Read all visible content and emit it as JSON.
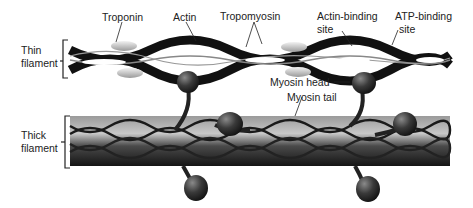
{
  "diagram": {
    "labels": {
      "thin_filament": [
        "Thin",
        "filament"
      ],
      "thick_filament": [
        "Thick",
        "filament"
      ],
      "troponin": "Troponin",
      "actin": "Actin",
      "tropomyosin": "Tropomyosin",
      "actin_binding_site": [
        "Actin-binding",
        "site"
      ],
      "atp_binding_site": [
        "ATP-binding",
        "site"
      ],
      "myosin_head": "Myosin head",
      "myosin_tail": "Myosin tail"
    },
    "colors": {
      "actin_bead": "#1a1a1a",
      "troponin": "#d8d8d8",
      "thick_band": "#6a6a6a",
      "label_text": "#222222"
    }
  }
}
